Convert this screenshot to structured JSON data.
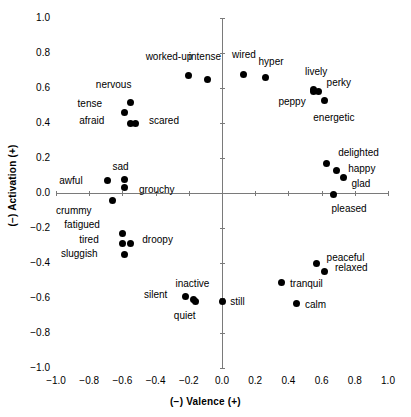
{
  "chart_data": {
    "type": "scatter",
    "title": "",
    "xlabel": "(−) Valence (+)",
    "ylabel": "(−) Activation (+)",
    "xlim": [
      -1.0,
      1.0
    ],
    "ylim": [
      -1.0,
      1.0
    ],
    "xticks": [
      "-1.0",
      "-0.8",
      "-0.6",
      "-0.4",
      "-0.2",
      "0.0",
      "0.2",
      "0.4",
      "0.6",
      "0.8",
      "1.0"
    ],
    "yticks": [
      "1.0",
      "0.8",
      "0.6",
      "0.4",
      "0.2",
      "0.0",
      "-0.2",
      "-0.4",
      "-0.6",
      "-0.8",
      "-1.0"
    ],
    "xtick_values": [
      -1.0,
      -0.8,
      -0.6,
      -0.4,
      -0.2,
      0.0,
      0.2,
      0.4,
      0.6,
      0.8,
      1.0
    ],
    "ytick_values": [
      1.0,
      0.8,
      0.6,
      0.4,
      0.2,
      0.0,
      -0.2,
      -0.4,
      -0.6,
      -0.8,
      -1.0
    ],
    "grid": false,
    "legend": "none",
    "axes_cross_at_origin": true,
    "marker": "filled-circle",
    "marker_color": "#000000",
    "axis_color": "#7a7a7a",
    "points": [
      {
        "label": "worked-up",
        "x": -0.2,
        "y": 0.67,
        "lx": -0.46,
        "ly": 0.78
      },
      {
        "label": "intense",
        "x": -0.09,
        "y": 0.65,
        "lx": -0.2,
        "ly": 0.78
      },
      {
        "label": "wired",
        "x": 0.13,
        "y": 0.68,
        "lx": 0.06,
        "ly": 0.79
      },
      {
        "label": "hyper",
        "x": 0.26,
        "y": 0.66,
        "lx": 0.22,
        "ly": 0.75
      },
      {
        "label": "lively",
        "x": 0.55,
        "y": 0.59,
        "lx": 0.5,
        "ly": 0.69
      },
      {
        "label": "perky",
        "x": 0.58,
        "y": 0.58,
        "lx": 0.63,
        "ly": 0.63
      },
      {
        "label": "peppy",
        "x": 0.55,
        "y": 0.58,
        "lx": 0.34,
        "ly": 0.52
      },
      {
        "label": "energetic",
        "x": 0.62,
        "y": 0.53,
        "lx": 0.55,
        "ly": 0.43
      },
      {
        "label": "nervous",
        "x": -0.55,
        "y": 0.52,
        "lx": -0.76,
        "ly": 0.62
      },
      {
        "label": "tense",
        "x": -0.59,
        "y": 0.46,
        "lx": -0.87,
        "ly": 0.51
      },
      {
        "label": "afraid",
        "x": -0.55,
        "y": 0.4,
        "lx": -0.86,
        "ly": 0.41
      },
      {
        "label": "scared",
        "x": -0.52,
        "y": 0.4,
        "lx": -0.44,
        "ly": 0.41
      },
      {
        "label": "delighted",
        "x": 0.63,
        "y": 0.17,
        "lx": 0.7,
        "ly": 0.23
      },
      {
        "label": "happy",
        "x": 0.69,
        "y": 0.13,
        "lx": 0.76,
        "ly": 0.14
      },
      {
        "label": "glad",
        "x": 0.73,
        "y": 0.09,
        "lx": 0.78,
        "ly": 0.05
      },
      {
        "label": "pleased",
        "x": 0.67,
        "y": -0.01,
        "lx": 0.66,
        "ly": -0.09
      },
      {
        "label": "sad",
        "x": -0.59,
        "y": 0.08,
        "lx": -0.66,
        "ly": 0.15
      },
      {
        "label": "awful",
        "x": -0.69,
        "y": 0.07,
        "lx": -0.98,
        "ly": 0.07
      },
      {
        "label": "grouchy",
        "x": -0.59,
        "y": 0.03,
        "lx": -0.5,
        "ly": 0.02
      },
      {
        "label": "crummy",
        "x": -0.66,
        "y": -0.04,
        "lx": -1.0,
        "ly": -0.1
      },
      {
        "label": "fatigued",
        "x": -0.6,
        "y": -0.23,
        "lx": -0.95,
        "ly": -0.18
      },
      {
        "label": "tired",
        "x": -0.6,
        "y": -0.29,
        "lx": -0.86,
        "ly": -0.27
      },
      {
        "label": "droopy",
        "x": -0.55,
        "y": -0.29,
        "lx": -0.48,
        "ly": -0.27
      },
      {
        "label": "sluggish",
        "x": -0.59,
        "y": -0.35,
        "lx": -0.97,
        "ly": -0.35
      },
      {
        "label": "peaceful",
        "x": 0.57,
        "y": -0.4,
        "lx": 0.63,
        "ly": -0.37
      },
      {
        "label": "relaxed",
        "x": 0.62,
        "y": -0.45,
        "lx": 0.68,
        "ly": -0.43
      },
      {
        "label": "tranquil",
        "x": 0.36,
        "y": -0.51,
        "lx": 0.41,
        "ly": -0.52
      },
      {
        "label": "calm",
        "x": 0.45,
        "y": -0.63,
        "lx": 0.5,
        "ly": -0.64
      },
      {
        "label": "silent",
        "x": -0.22,
        "y": -0.59,
        "lx": -0.47,
        "ly": -0.58
      },
      {
        "label": "inactive",
        "x": -0.17,
        "y": -0.61,
        "lx": -0.28,
        "ly": -0.52
      },
      {
        "label": "quiet",
        "x": -0.16,
        "y": -0.62,
        "lx": -0.29,
        "ly": -0.7
      },
      {
        "label": "still",
        "x": 0.0,
        "y": -0.62,
        "lx": 0.05,
        "ly": -0.62
      }
    ]
  }
}
